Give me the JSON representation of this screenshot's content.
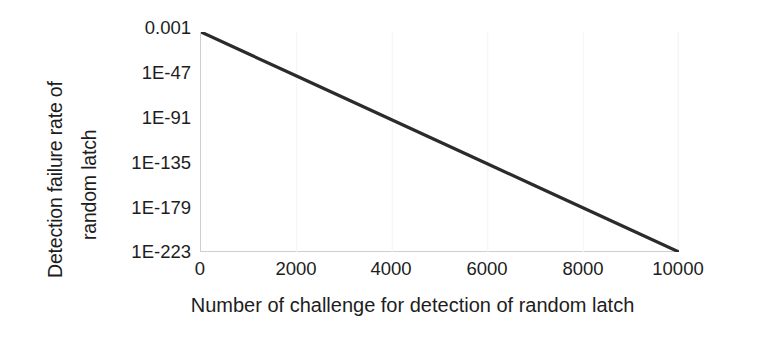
{
  "figure": {
    "background_color": "#ffffff",
    "line_color": "#2b2b2b",
    "axis_color": "#cfcfcf",
    "text_color": "#1d1d1d"
  },
  "axes": {
    "ylabel_line1": "Detection failure rate of",
    "ylabel_line2": "random latch",
    "xlabel": "Number of challenge for detection of random latch"
  },
  "chart_data": {
    "type": "line",
    "title": "",
    "xlabel": "Number of challenge for detection of random latch",
    "ylabel": "Detection failure rate of random latch",
    "yscale": "log",
    "xscale": "linear",
    "xlim": [
      0,
      10000
    ],
    "ylim": [
      1e-223,
      0.001
    ],
    "xticks": [
      0,
      2000,
      4000,
      6000,
      8000,
      10000
    ],
    "xticklabels": [
      "0",
      "2000",
      "4000",
      "6000",
      "8000",
      "10000"
    ],
    "yticks": [
      0.001,
      1e-47,
      1e-91,
      1e-135,
      1e-179,
      1e-223
    ],
    "yticklabels": [
      "0.001",
      "1E-47",
      "1E-91",
      "1E-135",
      "1E-179",
      "1E-223"
    ],
    "grid": false,
    "legend": null,
    "series": [
      {
        "name": "Detection failure rate of random latch",
        "x": [
          0,
          1000,
          2000,
          3000,
          4000,
          5000,
          6000,
          7000,
          8000,
          9000,
          10000
        ],
        "y_log10": [
          -3,
          -25,
          -47,
          -69,
          -91,
          -113,
          -135,
          -157,
          -179,
          -201,
          -223
        ],
        "y": [
          0.001,
          1e-25,
          1e-47,
          1e-69,
          1e-91,
          1e-113,
          1e-135,
          1e-157,
          1e-179,
          1e-201,
          1e-223
        ]
      }
    ]
  },
  "ytick_labels": [
    {
      "text": "0.001",
      "top_px": 19
    },
    {
      "text": "1E-47",
      "top_px": 64
    },
    {
      "text": "1E-91",
      "top_px": 109
    },
    {
      "text": "1E-135",
      "top_px": 154
    },
    {
      "text": "1E-179",
      "top_px": 199
    },
    {
      "text": "1E-223",
      "top_px": 243
    }
  ],
  "xtick_labels": [
    {
      "text": "0",
      "left_px": 200
    },
    {
      "text": "2000",
      "left_px": 296
    },
    {
      "text": "4000",
      "left_px": 391
    },
    {
      "text": "6000",
      "left_px": 487
    },
    {
      "text": "8000",
      "left_px": 583
    },
    {
      "text": "10000",
      "left_px": 678
    }
  ]
}
